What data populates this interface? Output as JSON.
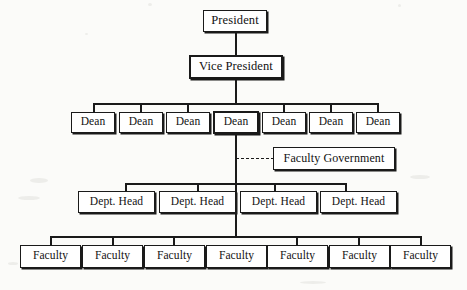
{
  "diagram": {
    "type": "organizational-chart",
    "levels": [
      {
        "level": 1,
        "name": "president",
        "nodes": [
          {
            "label": "President"
          }
        ]
      },
      {
        "level": 2,
        "name": "vice-president",
        "nodes": [
          {
            "label": "Vice President"
          }
        ]
      },
      {
        "level": 3,
        "name": "deans",
        "nodes": [
          {
            "label": "Dean"
          },
          {
            "label": "Dean"
          },
          {
            "label": "Dean"
          },
          {
            "label": "Dean"
          },
          {
            "label": "Dean"
          },
          {
            "label": "Dean"
          },
          {
            "label": "Dean"
          }
        ]
      },
      {
        "level": 4,
        "name": "advisory",
        "nodes": [
          {
            "label": "Faculty Government"
          }
        ]
      },
      {
        "level": 5,
        "name": "department-heads",
        "nodes": [
          {
            "label": "Dept. Head"
          },
          {
            "label": "Dept. Head"
          },
          {
            "label": "Dept. Head"
          },
          {
            "label": "Dept. Head"
          }
        ]
      },
      {
        "level": 6,
        "name": "faculty",
        "nodes": [
          {
            "label": "Faculty"
          },
          {
            "label": "Faculty"
          },
          {
            "label": "Faculty"
          },
          {
            "label": "Faculty"
          },
          {
            "label": "Faculty"
          },
          {
            "label": "Faculty"
          },
          {
            "label": "Faculty"
          }
        ]
      }
    ],
    "colors": {
      "line": "#1a1a1a",
      "box_fill": "#ffffff",
      "background": "#fbfbf9",
      "text": "#121212"
    },
    "connector_style": {
      "hierarchy": "solid",
      "advisory": "dashed"
    }
  }
}
